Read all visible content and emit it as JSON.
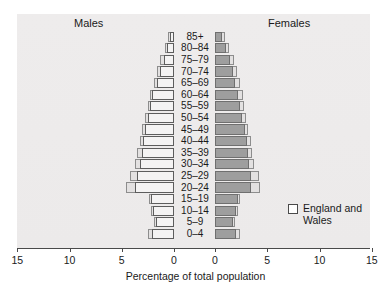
{
  "chart_data": {
    "type": "bar",
    "subtype": "population-pyramid",
    "title": "",
    "xlabel": "Percentage of total population",
    "ylabel": "",
    "orientation": "horizontal",
    "grid": false,
    "legend_position": "inside-right",
    "axis": {
      "left_ticks": [
        15,
        10,
        5,
        0
      ],
      "right_ticks": [
        0,
        5,
        10,
        15
      ],
      "max": 15,
      "units": "percent"
    },
    "categories": [
      "85+",
      "80–84",
      "75–79",
      "70–74",
      "65–69",
      "60–64",
      "55–59",
      "50–54",
      "45–49",
      "40–44",
      "35–39",
      "30–34",
      "25–29",
      "20–24",
      "15–19",
      "10–14",
      "5–9",
      "0–4"
    ],
    "series": [
      {
        "name": "Males",
        "side": "left",
        "swatch": "#f4f3f3",
        "values": [
          0.4,
          0.7,
          1.0,
          1.3,
          1.6,
          2.1,
          2.3,
          2.5,
          2.8,
          3.0,
          3.1,
          3.3,
          3.5,
          3.7,
          2.2,
          2.0,
          1.7,
          2.1
        ]
      },
      {
        "name": "Males (England and Wales)",
        "side": "left",
        "swatch": "#e3e1e1",
        "values": [
          0.6,
          0.9,
          1.3,
          1.6,
          1.9,
          2.3,
          2.5,
          2.8,
          3.1,
          3.3,
          3.5,
          3.7,
          4.2,
          4.6,
          2.4,
          2.2,
          1.9,
          2.5
        ]
      },
      {
        "name": "Females",
        "side": "right",
        "swatch": "#9e9e9e",
        "values": [
          0.7,
          1.1,
          1.4,
          1.7,
          1.9,
          2.2,
          2.4,
          2.6,
          2.9,
          3.1,
          3.2,
          3.3,
          3.4,
          3.4,
          2.2,
          2.0,
          1.7,
          2.0
        ]
      },
      {
        "name": "Females (England and Wales)",
        "side": "right",
        "swatch": "#e3e1e1",
        "values": [
          1.0,
          1.3,
          1.8,
          2.1,
          2.4,
          2.7,
          2.8,
          3.0,
          3.2,
          3.4,
          3.5,
          3.7,
          4.2,
          4.3,
          2.4,
          2.2,
          1.9,
          2.4
        ]
      }
    ]
  },
  "headers": {
    "males": "Males",
    "females": "Females"
  },
  "legend": {
    "label": "England and Wales"
  },
  "axis_title": "Percentage of total population",
  "top_sliver": ""
}
